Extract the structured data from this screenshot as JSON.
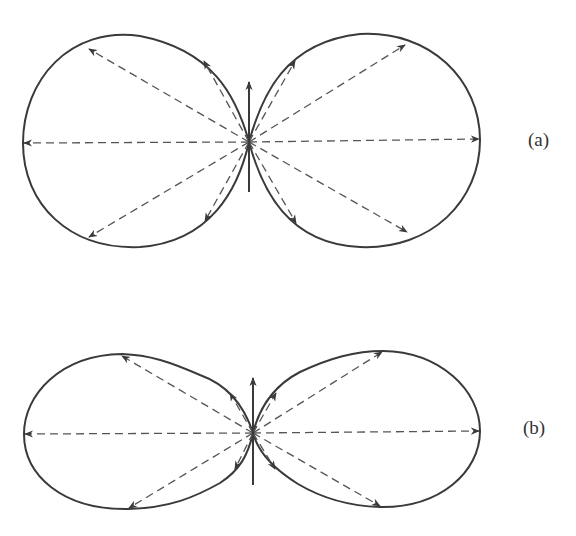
{
  "figure": {
    "panels": [
      {
        "id": "a",
        "label": "(a)",
        "description": "radiation pattern with two near-circular lobes",
        "ray_angles_deg": [
          0,
          32,
          64,
          116,
          148,
          180,
          212,
          244,
          296,
          328
        ],
        "has_vertical_axis_arrow": true
      },
      {
        "id": "b",
        "label": "(b)",
        "description": "radiation pattern with two flattened elliptical lobes",
        "ray_angles_deg": [
          0,
          32,
          64,
          116,
          148,
          180,
          212,
          244,
          296,
          328
        ],
        "has_vertical_axis_arrow": true
      }
    ],
    "colors": {
      "line": "#3a3a3a",
      "dashed": "#555555",
      "background": "#ffffff"
    }
  }
}
